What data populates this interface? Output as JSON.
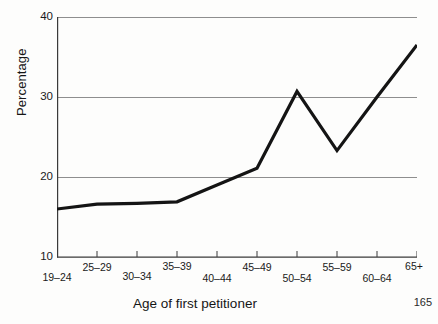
{
  "page": {
    "page_number": "165"
  },
  "chart_data": {
    "type": "line",
    "title": "",
    "xlabel": "Age of first petitioner",
    "ylabel": "Percentage",
    "categories": [
      "19–24",
      "25–29",
      "30–34",
      "35–39",
      "40–44",
      "45–49",
      "50–54",
      "55–59",
      "60–64",
      "65+"
    ],
    "values": [
      16.0,
      16.6,
      16.7,
      16.9,
      19.0,
      21.1,
      30.7,
      23.3,
      30.0,
      36.5
    ],
    "series": [
      {
        "name": "Percentage",
        "values": [
          16.0,
          16.6,
          16.7,
          16.9,
          19.0,
          21.1,
          30.7,
          23.3,
          30.0,
          36.5
        ]
      }
    ],
    "ylim": [
      10,
      40
    ],
    "yticks": [
      10,
      20,
      30,
      40
    ],
    "ytick_labels": [
      "10",
      "20",
      "30",
      "40"
    ],
    "grid": true,
    "grid_axis": "y",
    "legend": "none",
    "line_color": "#141414",
    "grid_color": "#8c8c8c",
    "axis_color": "#3a3a3a",
    "background": "#ffffff"
  }
}
